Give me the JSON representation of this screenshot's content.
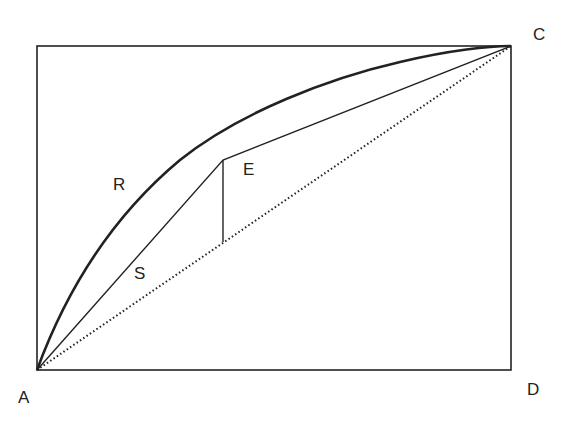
{
  "diagram": {
    "type": "geometric-curve-diagram",
    "frame": {
      "x1": 37,
      "y1": 46,
      "x2": 511,
      "y2": 370
    },
    "points": {
      "A": {
        "label": "A",
        "x": 37,
        "y": 370,
        "label_x": 18,
        "label_y": 389
      },
      "C": {
        "label": "C",
        "x": 511,
        "y": 46,
        "label_x": 533,
        "label_y": 26
      },
      "D": {
        "label": "D",
        "x": 511,
        "y": 370,
        "label_x": 527,
        "label_y": 381
      },
      "E": {
        "label": "E",
        "x": 223,
        "y": 160,
        "label_x": 243,
        "label_y": 161
      }
    },
    "curves": {
      "R": {
        "label": "R",
        "style": "thick solid",
        "label_x": 113,
        "label_y": 176
      },
      "S": {
        "label": "S",
        "style": "thin solid polyline A-E-C",
        "label_x": 134,
        "label_y": 265
      },
      "diagonal": {
        "style": "dotted",
        "from": "A",
        "to": "C"
      }
    },
    "vertical_segment": {
      "x": 223,
      "y_top": 160,
      "y_bottom": 242
    },
    "colors": {
      "stroke": "#222222",
      "background": "#ffffff"
    }
  }
}
